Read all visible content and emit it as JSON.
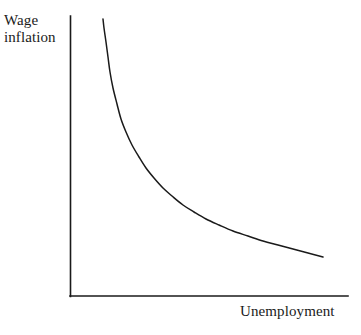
{
  "figure": {
    "background_color": "#ffffff",
    "ink_color": "#1a1a1a",
    "y_axis_label_line1": "Wage",
    "y_axis_label_line2": "inflation",
    "x_axis_label": "Unemployment"
  },
  "chart_data": {
    "type": "line",
    "title": "",
    "xlabel": "Unemployment",
    "ylabel": "Wage inflation",
    "grid": false,
    "legend": null,
    "ticks": {
      "x": [],
      "y": []
    },
    "axis_pixel_geometry": {
      "y_axis_x": 70,
      "y_axis_top_y": 16,
      "origin_x": 70,
      "origin_y": 296,
      "x_axis_right_x": 348
    },
    "series": [
      {
        "name": "Phillips curve",
        "color": "#1a1a1a",
        "shape": "convex-decreasing-hyperbola",
        "x": [
          103,
          104,
          106,
          108,
          110,
          113,
          117,
          121,
          126,
          132,
          139,
          146,
          154,
          163,
          172,
          183,
          194,
          206,
          219,
          233,
          248,
          263,
          278,
          293,
          308,
          323
        ],
        "y": [
          19,
          28,
          42,
          57,
          72,
          88,
          104,
          119,
          132,
          145,
          157,
          168,
          178,
          188,
          196,
          205,
          212,
          219,
          225,
          231,
          236,
          241,
          245,
          249,
          253,
          257
        ]
      }
    ]
  }
}
